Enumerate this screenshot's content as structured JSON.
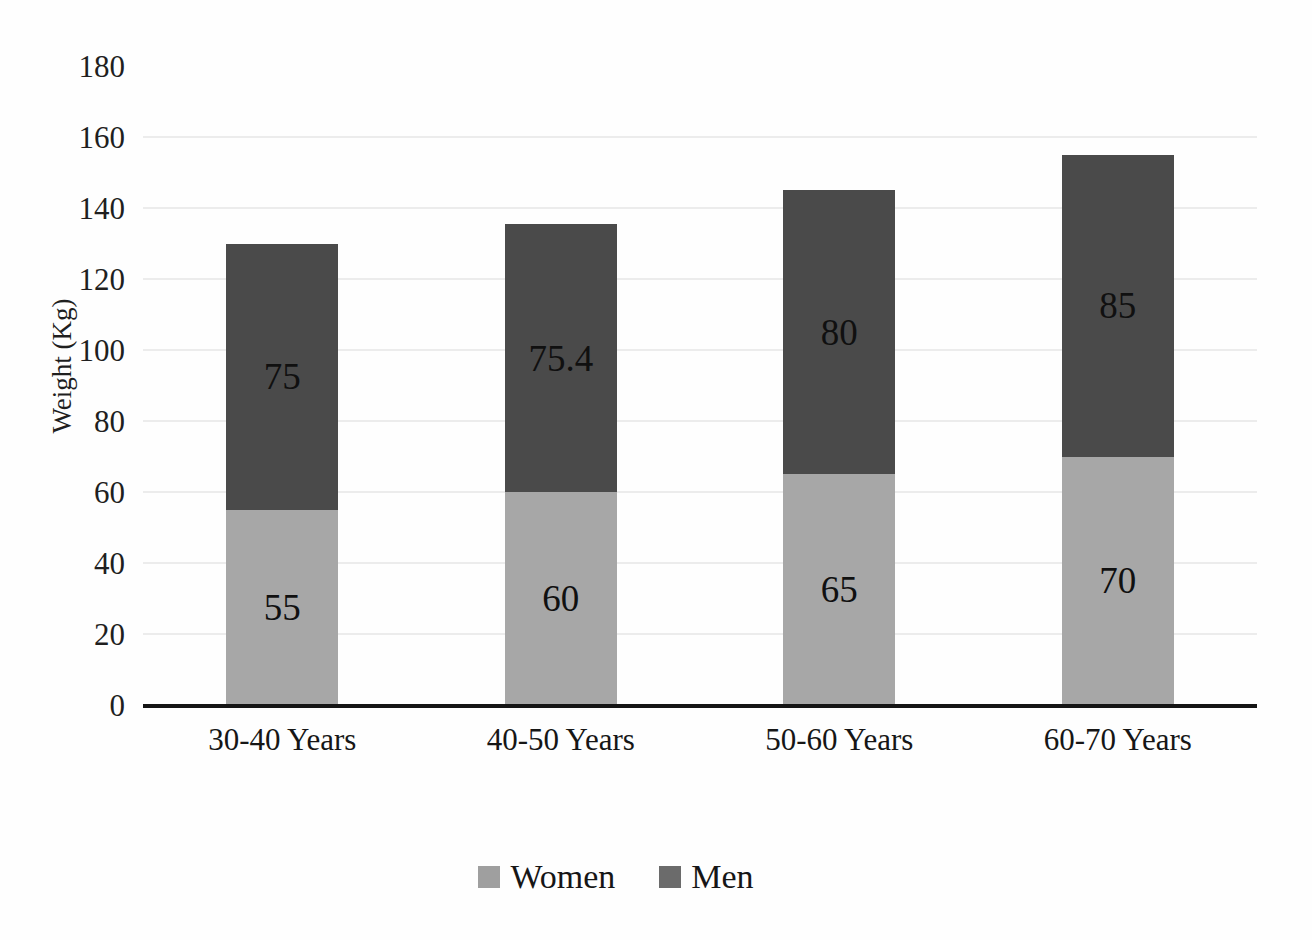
{
  "chart_data": {
    "type": "bar",
    "stacked": true,
    "categories": [
      "30-40 Years",
      "40-50 Years",
      "50-60 Years",
      "60-70 Years"
    ],
    "series": [
      {
        "name": "Women",
        "values": [
          55,
          60,
          65,
          70
        ],
        "color": "#a7a7a7",
        "legend_color": "#9f9f9f"
      },
      {
        "name": "Men",
        "values": [
          75,
          75.4,
          80,
          85
        ],
        "color": "#4a4a4a",
        "legend_color": "#6b6b6b"
      }
    ],
    "data_labels": {
      "Women": [
        "55",
        "60",
        "65",
        "70"
      ],
      "Men": [
        "75",
        "75.4",
        "80",
        "85"
      ]
    },
    "title": "",
    "xlabel": "",
    "ylabel": "Weight (Kg)",
    "ylim": [
      0,
      180
    ],
    "yticks": [
      0,
      20,
      40,
      60,
      80,
      100,
      120,
      140,
      160,
      180
    ],
    "grid": true,
    "gridline_color": "#ececec",
    "axis_line_color": "#151515",
    "legend_position": "bottom"
  }
}
